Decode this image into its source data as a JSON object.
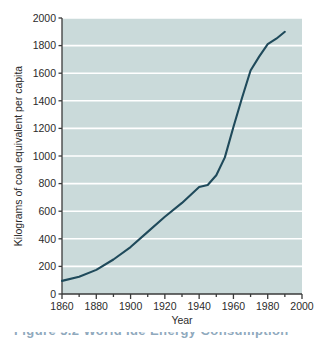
{
  "figure": {
    "caption": "Figure 5.2   World Ide Energy Consumption"
  },
  "colors": {
    "plot_background": "#cadada",
    "gridline": "#ffffff",
    "line": "#1f4a5b",
    "axis": "#3a3a3a",
    "text": "#2b2b2b"
  },
  "chart_data": {
    "type": "line",
    "title": "",
    "xlabel": "Year",
    "ylabel": "Kilograms of coal equivalent per capita",
    "xlim": [
      1860,
      2000
    ],
    "ylim": [
      0,
      2000
    ],
    "xticks": [
      1860,
      1880,
      1900,
      1920,
      1940,
      1960,
      1980,
      2000
    ],
    "xtick_labels": [
      "1860",
      "1880",
      "1900",
      "1920",
      "1940",
      "1960",
      "1980",
      "2000"
    ],
    "x_minor_tick_step": 10,
    "yticks": [
      0,
      200,
      400,
      600,
      800,
      1000,
      1200,
      1400,
      1600,
      1800,
      2000
    ],
    "ytick_labels": [
      "0",
      "200",
      "400",
      "600",
      "800",
      "1000",
      "1200",
      "1400",
      "1600",
      "1800",
      "2000"
    ],
    "grid": "horizontal",
    "legend": "none",
    "series": [
      {
        "name": "World energy consumption per capita",
        "x": [
          1860,
          1870,
          1880,
          1890,
          1900,
          1910,
          1920,
          1930,
          1940,
          1945,
          1950,
          1955,
          1960,
          1965,
          1970,
          1975,
          1980,
          1985,
          1990
        ],
        "values": [
          95,
          125,
          175,
          250,
          340,
          450,
          560,
          660,
          775,
          790,
          860,
          990,
          1210,
          1420,
          1620,
          1720,
          1810,
          1850,
          1900
        ]
      }
    ]
  }
}
